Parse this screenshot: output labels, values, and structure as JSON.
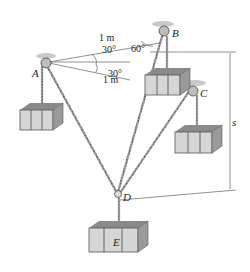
{
  "diagram": {
    "type": "statics-pulley-system",
    "points": {
      "A": {
        "label": "A",
        "x": 47,
        "y": 63
      },
      "B": {
        "label": "B",
        "x": 165,
        "y": 32
      },
      "C": {
        "label": "C",
        "x": 193,
        "y": 93
      },
      "D": {
        "label": "D",
        "x": 118,
        "y": 196
      },
      "E": {
        "label": "E",
        "x": 120,
        "y": 240
      }
    },
    "dimensions": {
      "ab_length": "1 m",
      "ac_length": "1 m",
      "angle_upper": "30°",
      "angle_lower": "30°",
      "angle_b": "60°",
      "sag": "s"
    },
    "crates": [
      {
        "name": "crate-a",
        "x": 20,
        "y": 105
      },
      {
        "name": "crate-b",
        "x": 145,
        "y": 68
      },
      {
        "name": "crate-c",
        "x": 175,
        "y": 125
      },
      {
        "name": "crate-e",
        "x": 90,
        "y": 220,
        "label": "E"
      }
    ],
    "colors": {
      "rope": "#8a8a8a",
      "crate_light": "#d6d6d6",
      "crate_dark": "#7a7a7a",
      "pulley_mount": "#c9c9c9",
      "line": "#333333"
    }
  }
}
